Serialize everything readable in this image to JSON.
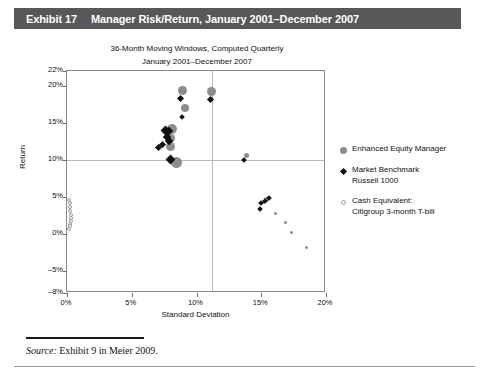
{
  "header": {
    "exhibit_number": "Exhibit 17",
    "title": "Manager Risk/Return, January 2001–December 2007",
    "bar_color": "#58585a",
    "text_color": "#ffffff"
  },
  "source": {
    "label": "Source:",
    "text": " Exhibit 9 in Meier 2009."
  },
  "legend": {
    "position": "right",
    "items": [
      {
        "marker": "filled-gray-circle",
        "color": "#8d8d8d",
        "label": "Enhanced Equity Manager"
      },
      {
        "marker": "filled-black-diamond",
        "color": "#111111",
        "label": "Market Benchmark\nRussell 1000"
      },
      {
        "marker": "open-circle",
        "color": "#ffffff",
        "label": "Cash Equivalent:\nCitigroup 3-month T-bill"
      }
    ]
  },
  "chart_data": {
    "type": "scatter",
    "title": "36-Month Moving Windows, Computed Quarterly",
    "subtitle": "January 2001–December 2007",
    "xlabel": "Standard Deviation",
    "ylabel": "Return",
    "xlim": [
      0,
      20
    ],
    "ylim": [
      -8,
      22
    ],
    "xticks": [
      0,
      5,
      10,
      15,
      20
    ],
    "xticklabels": [
      "0%",
      "5%",
      "10%",
      "15%",
      "20%"
    ],
    "yticks": [
      -8,
      -5,
      0,
      5,
      10,
      15,
      20,
      22
    ],
    "yticklabels": [
      "–8%",
      "–5%",
      "0%",
      "5%",
      "10%",
      "15%",
      "20%",
      "22%"
    ],
    "grid": true,
    "gridlines": {
      "horizontal": [
        10
      ],
      "vertical": [
        11.2
      ]
    },
    "series": [
      {
        "name": "Enhanced Equity Manager",
        "marker": "circle",
        "color": "#8d8d8d",
        "points": [
          {
            "x": 8.95,
            "y": 19.4,
            "size": 9
          },
          {
            "x": 11.15,
            "y": 19.2,
            "size": 9
          },
          {
            "x": 9.1,
            "y": 17.0,
            "size": 8
          },
          {
            "x": 8.1,
            "y": 14.1,
            "size": 10
          },
          {
            "x": 8.05,
            "y": 13.0,
            "size": 8
          },
          {
            "x": 8.0,
            "y": 11.8,
            "size": 9
          },
          {
            "x": 8.45,
            "y": 9.6,
            "size": 11
          },
          {
            "x": 13.85,
            "y": 10.6,
            "size": 5
          },
          {
            "x": 15.4,
            "y": 4.6,
            "size": 5
          },
          {
            "x": 15.2,
            "y": 4.3,
            "size": 4
          },
          {
            "x": 16.1,
            "y": 2.7,
            "size": 3
          },
          {
            "x": 16.9,
            "y": 1.5,
            "size": 3
          },
          {
            "x": 17.3,
            "y": 0.2,
            "size": 3
          },
          {
            "x": 18.5,
            "y": -1.8,
            "size": 3
          }
        ]
      },
      {
        "name": "Market Benchmark Russell 1000",
        "marker": "diamond",
        "color": "#111111",
        "points": [
          {
            "x": 8.8,
            "y": 18.3,
            "size": 5
          },
          {
            "x": 11.1,
            "y": 18.2,
            "size": 5
          },
          {
            "x": 8.9,
            "y": 15.8,
            "size": 4
          },
          {
            "x": 7.6,
            "y": 14.0,
            "size": 7
          },
          {
            "x": 7.9,
            "y": 13.9,
            "size": 6
          },
          {
            "x": 7.7,
            "y": 13.1,
            "size": 6
          },
          {
            "x": 7.85,
            "y": 12.6,
            "size": 6
          },
          {
            "x": 7.35,
            "y": 12.1,
            "size": 5
          },
          {
            "x": 7.1,
            "y": 11.6,
            "size": 5
          },
          {
            "x": 8.0,
            "y": 10.0,
            "size": 7
          },
          {
            "x": 13.7,
            "y": 10.0,
            "size": 4
          },
          {
            "x": 15.6,
            "y": 4.8,
            "size": 4
          },
          {
            "x": 15.3,
            "y": 4.4,
            "size": 4
          },
          {
            "x": 15.0,
            "y": 4.1,
            "size": 4
          },
          {
            "x": 14.9,
            "y": 3.4,
            "size": 4
          }
        ]
      },
      {
        "name": "Cash Equivalent: Citigroup 3-month T-bill",
        "marker": "circle-open",
        "color": "#ffffff",
        "points": [
          {
            "x": 0.16,
            "y": 4.6,
            "size": 4
          },
          {
            "x": 0.2,
            "y": 4.1,
            "size": 4
          },
          {
            "x": 0.24,
            "y": 3.6,
            "size": 4
          },
          {
            "x": 0.26,
            "y": 3.1,
            "size": 4
          },
          {
            "x": 0.3,
            "y": 2.6,
            "size": 4
          },
          {
            "x": 0.34,
            "y": 2.1,
            "size": 4
          },
          {
            "x": 0.3,
            "y": 1.7,
            "size": 4
          },
          {
            "x": 0.26,
            "y": 1.3,
            "size": 4
          },
          {
            "x": 0.2,
            "y": 1.0,
            "size": 4
          },
          {
            "x": 0.16,
            "y": 0.7,
            "size": 4
          }
        ]
      }
    ]
  }
}
